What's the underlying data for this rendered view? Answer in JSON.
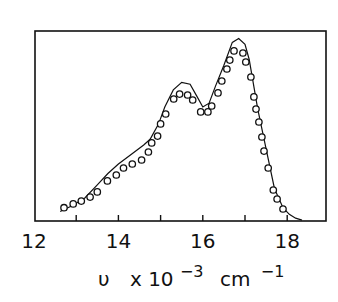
{
  "chart_data": {
    "type": "line",
    "title": "",
    "xlabel": "ν x 10^-3 cm^-1",
    "xlabel_parts": {
      "symbol": "υ",
      "mult": "x 10",
      "exp1": "−3",
      "unit": "cm",
      "exp2": "−1"
    },
    "ylabel": "",
    "xlim": [
      12,
      19
    ],
    "ylim": [
      0,
      1
    ],
    "x_ticks": [
      12,
      13,
      14,
      15,
      16,
      17,
      18
    ],
    "x_tick_labels": [
      "12",
      "14",
      "16",
      "18"
    ],
    "x_tick_label_values": [
      12,
      14,
      16,
      18
    ],
    "grid": false,
    "legend": null,
    "series": [
      {
        "name": "fit (solid line)",
        "style": "line",
        "x": [
          12.62,
          12.9,
          13.2,
          13.5,
          13.75,
          14.0,
          14.3,
          14.6,
          14.75,
          14.95,
          15.1,
          15.3,
          15.5,
          15.7,
          15.85,
          16.0,
          16.15,
          16.3,
          16.5,
          16.7,
          16.85,
          17.0,
          17.1,
          17.3,
          17.5,
          17.7,
          17.9,
          18.05,
          18.2,
          18.35
        ],
        "values": [
          0.05,
          0.08,
          0.12,
          0.19,
          0.25,
          0.3,
          0.35,
          0.4,
          0.43,
          0.51,
          0.6,
          0.69,
          0.73,
          0.72,
          0.66,
          0.6,
          0.62,
          0.71,
          0.82,
          0.94,
          0.96,
          0.93,
          0.85,
          0.59,
          0.38,
          0.17,
          0.07,
          0.035,
          0.015,
          0.005
        ]
      },
      {
        "name": "experimental (open circles)",
        "style": "scatter",
        "x": [
          12.71,
          12.93,
          13.12,
          13.33,
          13.5,
          13.74,
          13.95,
          14.12,
          14.33,
          14.55,
          14.71,
          14.79,
          14.93,
          15.0,
          15.12,
          15.31,
          15.45,
          15.64,
          15.76,
          15.95,
          16.12,
          16.21,
          16.36,
          16.45,
          16.57,
          16.64,
          16.74,
          16.95,
          17.02,
          17.14,
          17.21,
          17.26,
          17.33,
          17.4,
          17.45,
          17.55,
          17.67,
          17.76,
          17.9
        ],
        "values": [
          0.07,
          0.09,
          0.105,
          0.126,
          0.153,
          0.211,
          0.242,
          0.279,
          0.3,
          0.321,
          0.363,
          0.411,
          0.447,
          0.511,
          0.563,
          0.642,
          0.668,
          0.663,
          0.637,
          0.574,
          0.574,
          0.605,
          0.674,
          0.737,
          0.8,
          0.847,
          0.895,
          0.884,
          0.837,
          0.758,
          0.653,
          0.589,
          0.521,
          0.442,
          0.368,
          0.279,
          0.163,
          0.116,
          0.063
        ]
      }
    ]
  },
  "colors": {
    "ink": "#111111",
    "background": "#ffffff"
  }
}
